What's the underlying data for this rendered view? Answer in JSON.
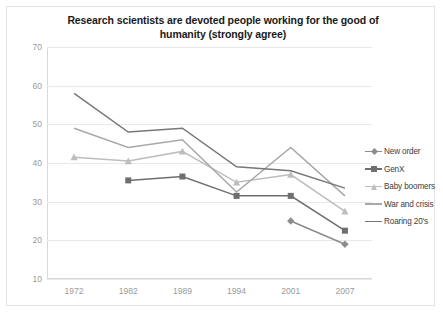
{
  "chart_data": {
    "type": "line",
    "title": "Research scientists are devoted people working for the good of humanity (strongly agree)",
    "title_line1": "Research scientists are devoted people working for the good of",
    "title_line2": "humanity (strongly agree)",
    "xlabel": "",
    "ylabel": "",
    "categories": [
      "1972",
      "1982",
      "1989",
      "1994",
      "2001",
      "2007"
    ],
    "ylim": [
      10,
      70
    ],
    "ytick_step": 10,
    "yticks": [
      "70",
      "60",
      "50",
      "40",
      "30",
      "20",
      "10"
    ],
    "grid": true,
    "legend_position": "right",
    "series": [
      {
        "name": "New order",
        "color": "#8c8c8c",
        "marker": "diamond",
        "x": [
          "2001",
          "2007"
        ],
        "values": [
          25,
          19
        ]
      },
      {
        "name": "GenX",
        "color": "#6e6e6e",
        "marker": "square",
        "x": [
          "1982",
          "1989",
          "1994",
          "2001",
          "2007"
        ],
        "values": [
          35.5,
          36.5,
          31.5,
          31.5,
          22.5
        ]
      },
      {
        "name": "Baby boomers",
        "color": "#bdbdbd",
        "marker": "triangle",
        "x": [
          "1972",
          "1982",
          "1989",
          "1994",
          "2001",
          "2007"
        ],
        "values": [
          41.5,
          40.5,
          43,
          35,
          37,
          27.5
        ]
      },
      {
        "name": "War and crisis",
        "color": "#a8a8a8",
        "marker": "none",
        "x": [
          "1972",
          "1982",
          "1989",
          "1994",
          "2001",
          "2007"
        ],
        "values": [
          49,
          44,
          46,
          32.5,
          44,
          31.5
        ]
      },
      {
        "name": "Roaring 20's",
        "color": "#777777",
        "marker": "none",
        "x": [
          "1972",
          "1982",
          "1989",
          "1994",
          "2001",
          "2007"
        ],
        "values": [
          58,
          48,
          49,
          39,
          38,
          33.5
        ]
      }
    ]
  },
  "legend": {
    "items": [
      {
        "label": "New order"
      },
      {
        "label": "GenX"
      },
      {
        "label": "Baby boomers"
      },
      {
        "label": "War and crisis"
      },
      {
        "label": "Roaring 20's"
      }
    ]
  }
}
